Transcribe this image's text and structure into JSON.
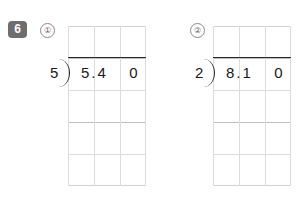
{
  "worksheet": {
    "exercise_number": "6",
    "problems": [
      {
        "marker": "①",
        "divisor": "5",
        "dividend_main": "5.4",
        "dividend_trailing": "0",
        "grid_columns": 3,
        "grid_rows": 5
      },
      {
        "marker": "②",
        "divisor": "2",
        "dividend_main": "8.1",
        "dividend_trailing": "0",
        "grid_columns": 3,
        "grid_rows": 5
      }
    ]
  },
  "colors": {
    "badge_background": "#6e6e6e",
    "badge_text": "#ffffff",
    "grid_line": "#dcdcdc",
    "grid_line_strong": "#bdbdbd",
    "ink": "#1a1a1a",
    "page_background": "#ffffff"
  }
}
